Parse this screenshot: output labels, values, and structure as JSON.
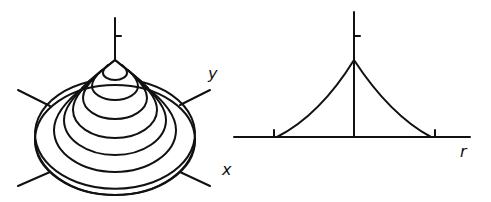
{
  "figure": {
    "left_panel": {
      "description": "3D cone-shaped surface with contour rings",
      "axis_labels": {
        "y": "y",
        "x": "x"
      },
      "contour_count": 7
    },
    "right_panel": {
      "description": "radial profile cross-section",
      "axis_labels": {
        "r": "r"
      }
    },
    "colors": {
      "line": "#111111",
      "background": "#ffffff"
    }
  }
}
